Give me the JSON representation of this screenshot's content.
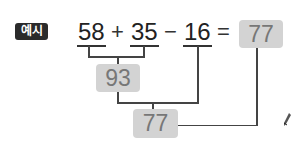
{
  "badge": {
    "label": "예시"
  },
  "equation": {
    "terms": [
      {
        "value": "58"
      },
      {
        "value": "35"
      },
      {
        "value": "16"
      }
    ],
    "operators": [
      "+",
      "−",
      "="
    ],
    "result": "77"
  },
  "steps": {
    "intermediate": "93",
    "final": "77"
  },
  "colors": {
    "box_fill": "#d3d3d3",
    "box_text": "#777777",
    "badge_fill": "#2b2b2b",
    "line": "#444444"
  }
}
